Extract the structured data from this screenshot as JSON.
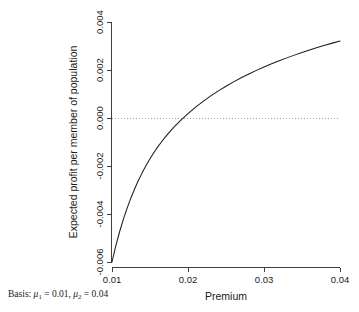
{
  "chart_data": {
    "type": "line",
    "title": "",
    "subtitle": "",
    "xlabel": "Premium",
    "ylabel": "Expected profit per member of population",
    "xlim": [
      0.01,
      0.04
    ],
    "ylim": [
      -0.006,
      0.004
    ],
    "xticks": [
      "0.01",
      "0.02",
      "0.03",
      "0.04"
    ],
    "xtick_values": [
      0.01,
      0.02,
      0.03,
      0.04
    ],
    "yticks": [
      "-0.006",
      "-0.004",
      "-0.002",
      "0.000",
      "0.002",
      "0.004"
    ],
    "ytick_values": [
      -0.006,
      -0.004,
      -0.002,
      0.0,
      0.002,
      0.004
    ],
    "grid": false,
    "legend": "none",
    "series": [
      {
        "name": "Expected profit",
        "color": "#1c1c1c",
        "style": "solid",
        "x": [
          0.01,
          0.0105,
          0.011,
          0.0115,
          0.012,
          0.0125,
          0.013,
          0.0135,
          0.014,
          0.0145,
          0.015,
          0.0155,
          0.016,
          0.0165,
          0.017,
          0.0175,
          0.018,
          0.0185,
          0.019,
          0.0195,
          0.02,
          0.021,
          0.022,
          0.023,
          0.024,
          0.025,
          0.026,
          0.027,
          0.028,
          0.029,
          0.03,
          0.031,
          0.032,
          0.033,
          0.034,
          0.035,
          0.036,
          0.037,
          0.038,
          0.039,
          0.04
        ],
        "y": [
          -0.006,
          -0.00533,
          -0.00474,
          -0.004215,
          -0.003745,
          -0.00332,
          -0.002935,
          -0.002585,
          -0.002265,
          -0.00197,
          -0.0017,
          -0.00145,
          -0.001215,
          -0.001,
          -0.0008,
          -0.00061,
          -0.000435,
          -0.00027,
          -0.00011,
          4e-05,
          0.00018,
          0.00045,
          0.000695,
          0.00092,
          0.00113,
          0.001325,
          0.001505,
          0.001675,
          0.001835,
          0.001985,
          0.002125,
          0.00226,
          0.002385,
          0.002505,
          0.00262,
          0.00273,
          0.002835,
          0.002935,
          0.00303,
          0.00312,
          0.003205
        ]
      }
    ],
    "annotations": [
      {
        "name": "zero-reference-line",
        "type": "hline",
        "y": 0.0,
        "style": "dotted",
        "color": "#8a8a8a"
      }
    ],
    "zero_crossing_x": 0.019
  },
  "caption": {
    "prefix": "Basis:",
    "mu_symbol": "μ",
    "term1_sub": "1",
    "term1_eq": "= 0.01,",
    "term2_sub": "2",
    "term2_eq": "= 0.04"
  },
  "axis_titles": {
    "x": "Premium",
    "y": "Expected profit per member of population"
  }
}
